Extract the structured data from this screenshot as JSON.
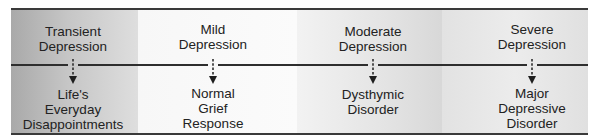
{
  "diagram": {
    "type": "continuum",
    "stages": [
      {
        "severity": "Transient Depression",
        "severity_lines": [
          "Transient",
          "Depression"
        ],
        "condition": "Life's Everyday Disappointments",
        "condition_lines": [
          "Life's",
          "Everyday",
          "Disappointments"
        ]
      },
      {
        "severity": "Mild Depression",
        "severity_lines": [
          "Mild",
          "Depression"
        ],
        "condition": "Normal Grief Response",
        "condition_lines": [
          "Normal",
          "Grief",
          "Response"
        ]
      },
      {
        "severity": "Moderate Depression",
        "severity_lines": [
          "Moderate",
          "Depression"
        ],
        "condition": "Dysthymic Disorder",
        "condition_lines": [
          "Dysthymic",
          "Disorder"
        ]
      },
      {
        "severity": "Severe Depression",
        "severity_lines": [
          "Severe",
          "Depression"
        ],
        "condition": "Major Depressive Disorder",
        "condition_lines": [
          "Major",
          "Depressive",
          "Disorder"
        ]
      }
    ],
    "colors": {
      "line": "#2e2e2e",
      "text": "#222222"
    }
  }
}
